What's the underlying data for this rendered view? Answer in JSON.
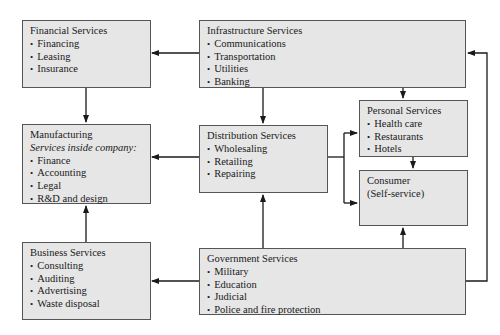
{
  "diagram": {
    "boxes": {
      "financial": {
        "title": "Financial Services",
        "items": [
          "Financing",
          "Leasing",
          "Insurance"
        ]
      },
      "infrastructure": {
        "title": "Infrastructure Services",
        "items": [
          "Communications",
          "Transportation",
          "Utilities",
          "Banking"
        ]
      },
      "manufacturing": {
        "title": "Manufacturing",
        "subtitle": "Services inside company:",
        "items": [
          "Finance",
          "Accounting",
          "Legal",
          "R&D and design"
        ]
      },
      "distribution": {
        "title": "Distribution Services",
        "items": [
          "Wholesaling",
          "Retailing",
          "Repairing"
        ]
      },
      "personal": {
        "title": "Personal Services",
        "items": [
          "Health care",
          "Restaurants",
          "Hotels"
        ]
      },
      "consumer": {
        "title": "Consumer",
        "subtitle": "(Self-service)"
      },
      "business": {
        "title": "Business Services",
        "items": [
          "Consulting",
          "Auditing",
          "Advertising",
          "Waste disposal"
        ]
      },
      "government": {
        "title": "Government Services",
        "items": [
          "Military",
          "Education",
          "Judicial",
          "Police and fire protection"
        ]
      }
    },
    "edges": [
      {
        "from": "Infrastructure Services",
        "to": "Financial Services"
      },
      {
        "from": "Infrastructure Services",
        "to": "Distribution Services"
      },
      {
        "from": "Infrastructure Services",
        "to": "Personal Services"
      },
      {
        "from": "Financial Services",
        "to": "Manufacturing"
      },
      {
        "from": "Distribution Services",
        "to": "Manufacturing"
      },
      {
        "from": "Distribution Services",
        "to": "Personal Services"
      },
      {
        "from": "Distribution Services",
        "to": "Consumer"
      },
      {
        "from": "Personal Services",
        "to": "Consumer"
      },
      {
        "from": "Business Services",
        "to": "Manufacturing"
      },
      {
        "from": "Government Services",
        "to": "Business Services"
      },
      {
        "from": "Government Services",
        "to": "Distribution Services"
      },
      {
        "from": "Government Services",
        "to": "Consumer"
      },
      {
        "from": "Government Services",
        "to": "Infrastructure Services"
      }
    ],
    "colors": {
      "box_fill": "#e6e6e6",
      "box_border": "#555555",
      "line": "#1a1a1a"
    }
  }
}
